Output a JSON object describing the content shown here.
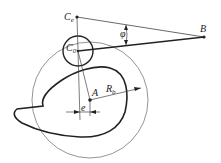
{
  "diagram": {
    "type": "cam-follower mechanism",
    "labels": {
      "Ce": "C",
      "Ce_sub": "e",
      "C0": "C",
      "C0_sub": "0",
      "B": "B",
      "phi": "φ",
      "A": "A",
      "Rb": "R",
      "Rb_sub": "b",
      "e": "e"
    },
    "colors": {
      "line": "#222222",
      "thin_line": "#555555",
      "background": "#ffffff"
    }
  }
}
